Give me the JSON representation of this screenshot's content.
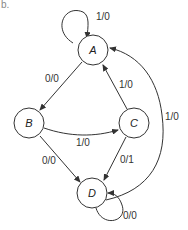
{
  "figure_label": "b.",
  "states": [
    {
      "id": "A",
      "label": "A"
    },
    {
      "id": "B",
      "label": "B"
    },
    {
      "id": "C",
      "label": "C"
    },
    {
      "id": "D",
      "label": "D"
    }
  ],
  "transitions": [
    {
      "from": "A",
      "to": "A",
      "label": "1/0"
    },
    {
      "from": "A",
      "to": "B",
      "label": "0/0"
    },
    {
      "from": "C",
      "to": "A",
      "label": "1/0"
    },
    {
      "from": "D",
      "to": "A",
      "label": "1/0"
    },
    {
      "from": "B",
      "to": "C",
      "label": "1/0"
    },
    {
      "from": "B",
      "to": "D",
      "label": "0/0"
    },
    {
      "from": "C",
      "to": "D",
      "label": "0/1"
    },
    {
      "from": "D",
      "to": "D",
      "label": "0/0"
    }
  ]
}
